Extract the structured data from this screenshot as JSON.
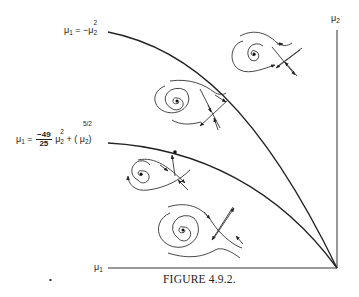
{
  "figure": {
    "caption": "FIGURE 4.9.2.",
    "axes": {
      "horizontal_label": "μ",
      "horizontal_label_sub": "1",
      "vertical_label": "μ",
      "vertical_label_sub": "2"
    },
    "curves": [
      {
        "name": "outer-bifurcation-curve",
        "label_lhs": "μ",
        "label_lhs_sub": "1",
        "label_eq": " = −μ",
        "label_sub": "2",
        "label_sup": "2",
        "equation": "μ1 = −μ2^2"
      },
      {
        "name": "homoclinic-bifurcation-curve",
        "label_lhs": "μ",
        "label_lhs_sub": "1",
        "label_eq": " = ",
        "frac_num": "−49",
        "frac_den": "25",
        "term1": " μ",
        "term1_sub": "2",
        "term1_sup": "2",
        "plus": " + ( μ",
        "term2_sub": "2",
        "term2_sup_num": "5",
        "term2_sup_den": "2",
        "close": ")",
        "equation": "μ1 = (−49/25) μ2^2 + (μ2^(5/2))"
      }
    ],
    "phase_portraits": [
      {
        "region": "top-right",
        "description": "spiral focus with saddle, unstable manifold loops outside"
      },
      {
        "region": "middle",
        "description": "spiral with saddle between curves"
      },
      {
        "region": "on-homoclinic-curve",
        "description": "homoclinic orbit connecting saddle"
      },
      {
        "region": "bottom",
        "description": "spiral with saddle below homoclinic curve"
      }
    ],
    "stray_mark": "•"
  }
}
